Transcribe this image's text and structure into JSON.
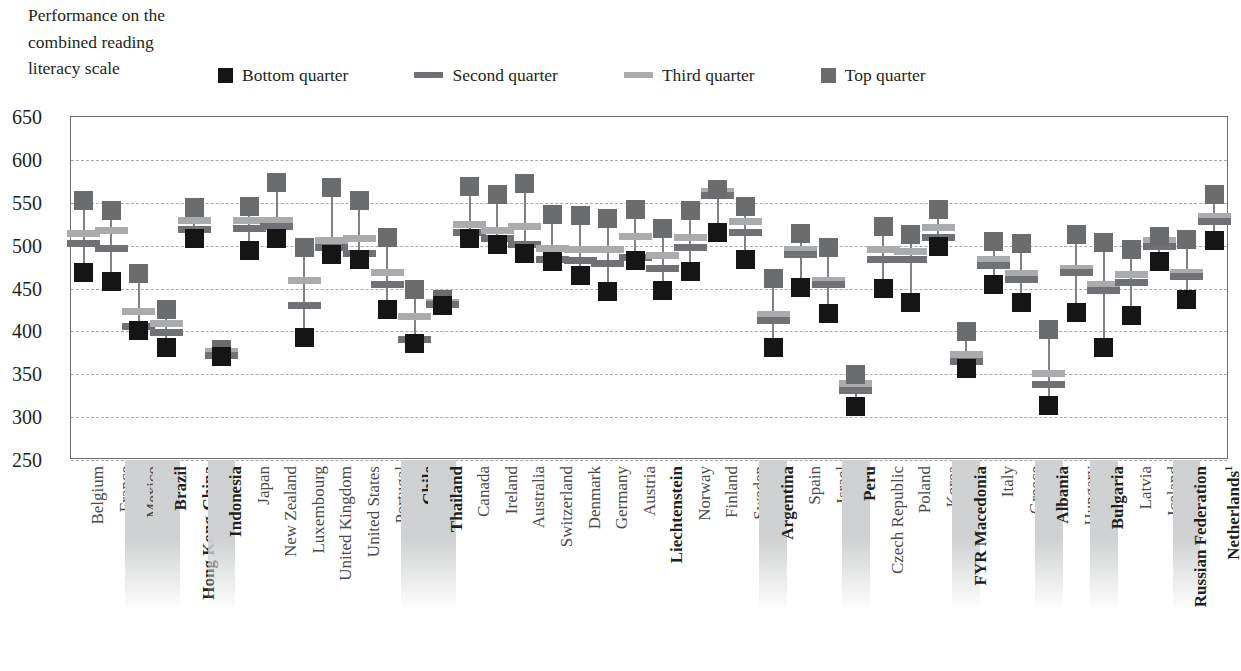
{
  "title_lines": [
    "Performance on the",
    "combined reading",
    "literacy scale"
  ],
  "legend": {
    "items": [
      {
        "label": "Bottom quarter",
        "marker": "square",
        "color": "#151515",
        "icon": "filled-square-icon"
      },
      {
        "label": "Second quarter",
        "marker": "dash",
        "color": "#6f7174",
        "icon": "horizontal-dash-icon"
      },
      {
        "label": "Third quarter",
        "marker": "dash",
        "color": "#a9abad",
        "icon": "horizontal-dash-icon"
      },
      {
        "label": "Top quarter",
        "marker": "square",
        "color": "#6a6c6e",
        "icon": "filled-square-icon"
      }
    ]
  },
  "axis": {
    "y_ticks": [
      650,
      600,
      550,
      500,
      450,
      400,
      350,
      300,
      250
    ],
    "y_min": 250,
    "y_max": 650
  },
  "chart_data": {
    "type": "scatter",
    "title": "Performance on the combined reading literacy scale",
    "xlabel": "",
    "ylabel": "Performance on the combined reading literacy scale",
    "ylim": [
      250,
      650
    ],
    "ytick_step": 50,
    "grid": true,
    "legend_position": "top",
    "series_names": [
      "Bottom quarter",
      "Second quarter",
      "Third quarter",
      "Top quarter"
    ],
    "categories": [
      "Belgium",
      "France",
      "Mexico",
      "Brazil",
      "Hong Kong-China",
      "Indonesia",
      "Japan",
      "New Zealand",
      "Luxembourg",
      "United Kingdom",
      "United States",
      "Portugal",
      "Chile",
      "Thailand",
      "Canada",
      "Ireland",
      "Australia",
      "Switzerland",
      "Denmark",
      "Germany",
      "Austria",
      "Liechtenstein",
      "Norway",
      "Finland",
      "Sweden",
      "Argentina",
      "Spain",
      "Israel",
      "Peru",
      "Czech Republic",
      "Poland",
      "Korea",
      "FYR Macedonia",
      "Italy",
      "Greece",
      "Albania",
      "Hungary",
      "Bulgaria",
      "Latvia",
      "Iceland",
      "Russian Federation",
      "Netherlands"
    ],
    "highlighted_categories": [
      "Mexico",
      "Brazil",
      "Indonesia",
      "Chile",
      "Thailand",
      "Argentina",
      "Peru",
      "FYR Macedonia",
      "Albania",
      "Bulgaria",
      "Russian Federation"
    ],
    "bold_categories": [
      "Brazil",
      "Hong Kong-China",
      "Indonesia",
      "Chile",
      "Thailand",
      "Liechtenstein",
      "Argentina",
      "Peru",
      "FYR Macedonia",
      "Albania",
      "Bulgaria",
      "Russian Federation",
      "Netherlands"
    ],
    "footnote_categories": {
      "Netherlands": "1"
    },
    "points": [
      {
        "category": "Belgium",
        "bottom": 467,
        "second": 501,
        "third": 513,
        "top": 551
      },
      {
        "category": "France",
        "bottom": 457,
        "second": 496,
        "third": 516,
        "top": 540
      },
      {
        "category": "Mexico",
        "bottom": 400,
        "second": 405,
        "third": 422,
        "top": 466
      },
      {
        "category": "Brazil",
        "bottom": 380,
        "second": 398,
        "third": 408,
        "top": 424
      },
      {
        "category": "Hong Kong-China",
        "bottom": 507,
        "second": 518,
        "third": 528,
        "top": 543
      },
      {
        "category": "Indonesia",
        "bottom": 369,
        "second": 371,
        "third": 375,
        "top": 378
      },
      {
        "category": "Japan",
        "bottom": 493,
        "second": 519,
        "third": 528,
        "top": 545
      },
      {
        "category": "New Zealand",
        "bottom": 507,
        "second": 521,
        "third": 528,
        "top": 573
      },
      {
        "category": "Luxembourg",
        "bottom": 392,
        "second": 429,
        "third": 458,
        "top": 497
      },
      {
        "category": "United Kingdom",
        "bottom": 488,
        "second": 497,
        "third": 505,
        "top": 567
      },
      {
        "category": "United States",
        "bottom": 483,
        "second": 490,
        "third": 507,
        "top": 551
      },
      {
        "category": "Portugal",
        "bottom": 424,
        "second": 453,
        "third": 467,
        "top": 508
      },
      {
        "category": "Chile",
        "bottom": 385,
        "second": 389,
        "third": 416,
        "top": 448
      },
      {
        "category": "Thailand",
        "bottom": 429,
        "second": 430,
        "third": 433,
        "top": 436
      },
      {
        "category": "Canada",
        "bottom": 507,
        "second": 514,
        "third": 524,
        "top": 568
      },
      {
        "category": "Ireland",
        "bottom": 500,
        "second": 507,
        "third": 517,
        "top": 559
      },
      {
        "category": "Australia",
        "bottom": 490,
        "second": 500,
        "third": 521,
        "top": 571
      },
      {
        "category": "Switzerland",
        "bottom": 480,
        "second": 483,
        "third": 495,
        "top": 535
      },
      {
        "category": "Denmark",
        "bottom": 464,
        "second": 481,
        "third": 494,
        "top": 534
      },
      {
        "category": "Germany",
        "bottom": 445,
        "second": 478,
        "third": 494,
        "top": 531
      },
      {
        "category": "Austria",
        "bottom": 482,
        "second": 485,
        "third": 510,
        "top": 541
      },
      {
        "category": "Liechtenstein",
        "bottom": 447,
        "second": 472,
        "third": 487,
        "top": 519
      },
      {
        "category": "Norway",
        "bottom": 469,
        "second": 497,
        "third": 508,
        "top": 540
      },
      {
        "category": "Finland",
        "bottom": 514,
        "second": 557,
        "third": 562,
        "top": 564
      },
      {
        "category": "Sweden",
        "bottom": 483,
        "second": 514,
        "third": 527,
        "top": 544
      },
      {
        "category": "Argentina",
        "bottom": 380,
        "second": 412,
        "third": 418,
        "top": 461
      },
      {
        "category": "Spain",
        "bottom": 450,
        "second": 488,
        "third": 494,
        "top": 513
      },
      {
        "category": "Israel",
        "bottom": 420,
        "second": 453,
        "third": 458,
        "top": 497
      },
      {
        "category": "Peru",
        "bottom": 311,
        "second": 330,
        "third": 338,
        "top": 348
      },
      {
        "category": "Czech Republic",
        "bottom": 449,
        "second": 483,
        "third": 494,
        "top": 521
      },
      {
        "category": "Poland",
        "bottom": 432,
        "second": 483,
        "third": 492,
        "top": 512
      },
      {
        "category": "Korea",
        "bottom": 498,
        "second": 508,
        "third": 520,
        "top": 541
      },
      {
        "category": "FYR Macedonia",
        "bottom": 355,
        "second": 364,
        "third": 372,
        "top": 399
      },
      {
        "category": "Italy",
        "bottom": 454,
        "second": 476,
        "third": 483,
        "top": 504
      },
      {
        "category": "Greece",
        "bottom": 433,
        "second": 459,
        "third": 466,
        "top": 501
      },
      {
        "category": "Albania",
        "bottom": 312,
        "second": 337,
        "third": 350,
        "top": 401
      },
      {
        "category": "Hungary",
        "bottom": 421,
        "second": 468,
        "third": 472,
        "top": 512
      },
      {
        "category": "Bulgaria",
        "bottom": 380,
        "second": 447,
        "third": 453,
        "top": 502
      },
      {
        "category": "Latvia",
        "bottom": 417,
        "second": 456,
        "third": 465,
        "top": 494
      },
      {
        "category": "Iceland",
        "bottom": 480,
        "second": 498,
        "third": 505,
        "top": 510
      },
      {
        "category": "Russian Federation",
        "bottom": 436,
        "second": 463,
        "third": 468,
        "top": 506
      },
      {
        "category": "Netherlands",
        "bottom": 505,
        "second": 527,
        "third": 533,
        "top": 558
      }
    ]
  }
}
